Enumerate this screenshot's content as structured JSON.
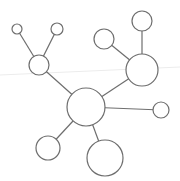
{
  "diagram": {
    "type": "network-graph",
    "colors": {
      "background": "#ffffff",
      "stroke": "#6e6e6e",
      "guide": "#ececec"
    },
    "guide_line": {
      "x1": 0,
      "y1": 75,
      "x2": 180,
      "y2": 67
    },
    "nodes": [
      {
        "id": "hub",
        "cx": 86,
        "cy": 107,
        "r": 19
      },
      {
        "id": "left-mid",
        "cx": 39,
        "cy": 65,
        "r": 10
      },
      {
        "id": "top-left-small",
        "cx": 17,
        "cy": 29,
        "r": 5
      },
      {
        "id": "top-left",
        "cx": 57,
        "cy": 29,
        "r": 6
      },
      {
        "id": "right-upper",
        "cx": 142,
        "cy": 70,
        "r": 16
      },
      {
        "id": "top-mid",
        "cx": 104,
        "cy": 39,
        "r": 10
      },
      {
        "id": "top-right",
        "cx": 142,
        "cy": 21,
        "r": 10
      },
      {
        "id": "right-small",
        "cx": 161,
        "cy": 110,
        "r": 8
      },
      {
        "id": "bottom-left",
        "cx": 48,
        "cy": 148,
        "r": 12
      },
      {
        "id": "bottom",
        "cx": 105,
        "cy": 158,
        "r": 18
      }
    ],
    "edges": [
      {
        "from": "hub",
        "to": "left-mid"
      },
      {
        "from": "left-mid",
        "to": "top-left-small"
      },
      {
        "from": "left-mid",
        "to": "top-left"
      },
      {
        "from": "hub",
        "to": "right-upper"
      },
      {
        "from": "right-upper",
        "to": "top-mid"
      },
      {
        "from": "right-upper",
        "to": "top-right"
      },
      {
        "from": "hub",
        "to": "right-small"
      },
      {
        "from": "hub",
        "to": "bottom-left"
      },
      {
        "from": "hub",
        "to": "bottom"
      }
    ]
  }
}
